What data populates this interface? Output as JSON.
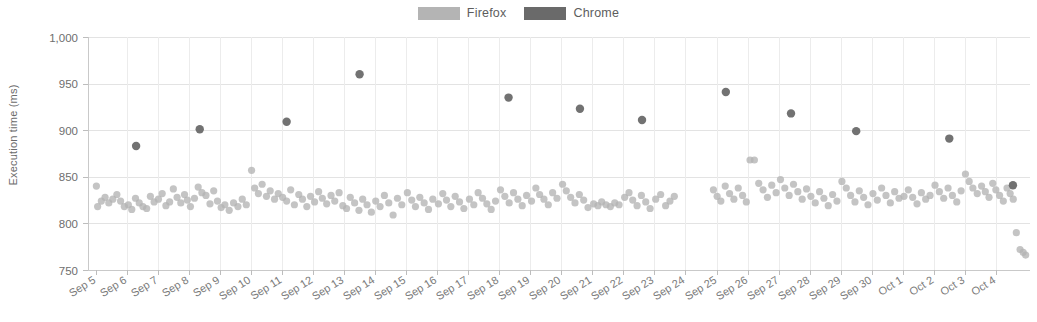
{
  "chart_data": {
    "type": "scatter",
    "title": "",
    "xlabel": "",
    "ylabel": "Execution time (ms)",
    "ylim": [
      750,
      1000
    ],
    "yticks": [
      750,
      800,
      850,
      900,
      950,
      1000
    ],
    "ytick_labels": [
      "750",
      "800",
      "850",
      "900",
      "950",
      "1,000"
    ],
    "grid": true,
    "legend_position": "top-center",
    "categories": [
      "Sep 5",
      "Sep 6",
      "Sep 7",
      "Sep 8",
      "Sep 9",
      "Sep 10",
      "Sep 11",
      "Sep 12",
      "Sep 13",
      "Sep 14",
      "Sep 15",
      "Sep 16",
      "Sep 17",
      "Sep 18",
      "Sep 19",
      "Sep 20",
      "Sep 21",
      "Sep 22",
      "Sep 23",
      "Sep 24",
      "Sep 25",
      "Sep 26",
      "Sep 27",
      "Sep 28",
      "Sep 29",
      "Sep 30",
      "Oct 1",
      "Oct 2",
      "Oct 3",
      "Oct 4"
    ],
    "series": [
      {
        "name": "Firefox",
        "color": "#b4b4b4",
        "points": [
          [
            5.02,
            840
          ],
          [
            5.06,
            818
          ],
          [
            5.18,
            824
          ],
          [
            5.3,
            828
          ],
          [
            5.42,
            822
          ],
          [
            5.55,
            826
          ],
          [
            5.68,
            831
          ],
          [
            5.8,
            824
          ],
          [
            5.92,
            818
          ],
          [
            6.05,
            820
          ],
          [
            6.16,
            815
          ],
          [
            6.28,
            827
          ],
          [
            6.4,
            822
          ],
          [
            6.52,
            818
          ],
          [
            6.64,
            816
          ],
          [
            6.76,
            829
          ],
          [
            6.88,
            823
          ],
          [
            7.02,
            826
          ],
          [
            7.14,
            832
          ],
          [
            7.26,
            819
          ],
          [
            7.38,
            823
          ],
          [
            7.5,
            837
          ],
          [
            7.62,
            828
          ],
          [
            7.74,
            822
          ],
          [
            7.86,
            831
          ],
          [
            7.95,
            825
          ],
          [
            8.05,
            818
          ],
          [
            8.18,
            827
          ],
          [
            8.3,
            839
          ],
          [
            8.42,
            833
          ],
          [
            8.55,
            830
          ],
          [
            8.68,
            821
          ],
          [
            8.8,
            835
          ],
          [
            8.92,
            824
          ],
          [
            9.04,
            817
          ],
          [
            9.16,
            820
          ],
          [
            9.3,
            814
          ],
          [
            9.44,
            822
          ],
          [
            9.58,
            818
          ],
          [
            9.72,
            826
          ],
          [
            9.85,
            820
          ],
          [
            10.02,
            857
          ],
          [
            10.12,
            838
          ],
          [
            10.24,
            832
          ],
          [
            10.36,
            842
          ],
          [
            10.5,
            829
          ],
          [
            10.62,
            835
          ],
          [
            10.76,
            826
          ],
          [
            10.88,
            832
          ],
          [
            11.02,
            828
          ],
          [
            11.15,
            824
          ],
          [
            11.28,
            836
          ],
          [
            11.4,
            820
          ],
          [
            11.54,
            831
          ],
          [
            11.66,
            826
          ],
          [
            11.8,
            818
          ],
          [
            11.92,
            829
          ],
          [
            12.05,
            823
          ],
          [
            12.18,
            834
          ],
          [
            12.3,
            827
          ],
          [
            12.44,
            821
          ],
          [
            12.58,
            830
          ],
          [
            12.7,
            824
          ],
          [
            12.84,
            833
          ],
          [
            12.96,
            819
          ],
          [
            13.08,
            816
          ],
          [
            13.2,
            828
          ],
          [
            13.34,
            822
          ],
          [
            13.48,
            814
          ],
          [
            13.6,
            826
          ],
          [
            13.74,
            820
          ],
          [
            13.88,
            812
          ],
          [
            14.02,
            824
          ],
          [
            14.16,
            818
          ],
          [
            14.3,
            830
          ],
          [
            14.44,
            822
          ],
          [
            14.58,
            809
          ],
          [
            14.72,
            827
          ],
          [
            14.86,
            820
          ],
          [
            15.04,
            833
          ],
          [
            15.18,
            825
          ],
          [
            15.3,
            818
          ],
          [
            15.44,
            828
          ],
          [
            15.58,
            822
          ],
          [
            15.72,
            815
          ],
          [
            15.86,
            826
          ],
          [
            16.04,
            821
          ],
          [
            16.18,
            832
          ],
          [
            16.3,
            825
          ],
          [
            16.44,
            818
          ],
          [
            16.58,
            829
          ],
          [
            16.72,
            823
          ],
          [
            16.86,
            816
          ],
          [
            17.04,
            826
          ],
          [
            17.18,
            820
          ],
          [
            17.32,
            833
          ],
          [
            17.46,
            827
          ],
          [
            17.6,
            821
          ],
          [
            17.74,
            815
          ],
          [
            17.88,
            824
          ],
          [
            18.04,
            836
          ],
          [
            18.18,
            829
          ],
          [
            18.32,
            822
          ],
          [
            18.46,
            833
          ],
          [
            18.6,
            826
          ],
          [
            18.74,
            819
          ],
          [
            18.88,
            830
          ],
          [
            19.04,
            824
          ],
          [
            19.18,
            838
          ],
          [
            19.3,
            831
          ],
          [
            19.44,
            826
          ],
          [
            19.58,
            820
          ],
          [
            19.72,
            833
          ],
          [
            19.86,
            827
          ],
          [
            20.04,
            842
          ],
          [
            20.16,
            835
          ],
          [
            20.3,
            828
          ],
          [
            20.44,
            822
          ],
          [
            20.58,
            831
          ],
          [
            20.72,
            825
          ],
          [
            20.86,
            817
          ],
          [
            21.04,
            821
          ],
          [
            21.18,
            819
          ],
          [
            21.3,
            823
          ],
          [
            21.44,
            820
          ],
          [
            21.58,
            818
          ],
          [
            21.72,
            822
          ],
          [
            21.86,
            820
          ],
          [
            22.04,
            828
          ],
          [
            22.18,
            833
          ],
          [
            22.3,
            825
          ],
          [
            22.44,
            819
          ],
          [
            22.58,
            830
          ],
          [
            22.72,
            823
          ],
          [
            22.86,
            816
          ],
          [
            23.04,
            826
          ],
          [
            23.2,
            831
          ],
          [
            23.36,
            819
          ],
          [
            23.5,
            824
          ],
          [
            23.64,
            829
          ],
          [
            24.9,
            836
          ],
          [
            25.02,
            829
          ],
          [
            25.14,
            824
          ],
          [
            25.28,
            840
          ],
          [
            25.42,
            832
          ],
          [
            25.56,
            826
          ],
          [
            25.7,
            838
          ],
          [
            25.84,
            830
          ],
          [
            25.96,
            823
          ],
          [
            26.08,
            868
          ],
          [
            26.22,
            868
          ],
          [
            26.36,
            843
          ],
          [
            26.5,
            836
          ],
          [
            26.64,
            828
          ],
          [
            26.78,
            841
          ],
          [
            26.92,
            833
          ],
          [
            27.06,
            847
          ],
          [
            27.2,
            838
          ],
          [
            27.34,
            830
          ],
          [
            27.48,
            842
          ],
          [
            27.62,
            834
          ],
          [
            27.76,
            826
          ],
          [
            27.9,
            837
          ],
          [
            28.04,
            829
          ],
          [
            28.18,
            822
          ],
          [
            28.32,
            834
          ],
          [
            28.46,
            827
          ],
          [
            28.6,
            819
          ],
          [
            28.74,
            831
          ],
          [
            28.88,
            824
          ],
          [
            29.04,
            845
          ],
          [
            29.18,
            838
          ],
          [
            29.32,
            830
          ],
          [
            29.46,
            823
          ],
          [
            29.6,
            835
          ],
          [
            29.74,
            828
          ],
          [
            29.88,
            820
          ],
          [
            30.04,
            832
          ],
          [
            30.18,
            825
          ],
          [
            30.32,
            838
          ],
          [
            30.46,
            830
          ],
          [
            30.6,
            822
          ],
          [
            30.74,
            834
          ],
          [
            30.88,
            827
          ],
          [
            31.04,
            829
          ],
          [
            31.18,
            836
          ],
          [
            31.32,
            828
          ],
          [
            31.46,
            821
          ],
          [
            31.6,
            833
          ],
          [
            31.74,
            826
          ],
          [
            31.88,
            830
          ],
          [
            32.04,
            841
          ],
          [
            32.18,
            834
          ],
          [
            32.32,
            827
          ],
          [
            32.46,
            838
          ],
          [
            32.6,
            830
          ],
          [
            32.74,
            823
          ],
          [
            32.88,
            835
          ],
          [
            33.02,
            853
          ],
          [
            33.14,
            845
          ],
          [
            33.26,
            838
          ],
          [
            33.4,
            832
          ],
          [
            33.54,
            840
          ],
          [
            33.66,
            834
          ],
          [
            33.78,
            828
          ],
          [
            33.9,
            843
          ],
          [
            34.0,
            836
          ],
          [
            34.12,
            830
          ],
          [
            34.24,
            824
          ],
          [
            34.36,
            838
          ],
          [
            34.46,
            832
          ],
          [
            34.56,
            826
          ],
          [
            34.66,
            790
          ],
          [
            34.78,
            772
          ],
          [
            34.88,
            769
          ],
          [
            34.96,
            766
          ]
        ]
      },
      {
        "name": "Chrome",
        "color": "#6a6a6a",
        "points": [
          [
            6.3,
            883
          ],
          [
            8.35,
            901
          ],
          [
            11.15,
            909
          ],
          [
            13.5,
            960
          ],
          [
            18.3,
            935
          ],
          [
            20.6,
            923
          ],
          [
            22.6,
            911
          ],
          [
            25.3,
            941
          ],
          [
            27.4,
            918
          ],
          [
            29.5,
            899
          ],
          [
            32.5,
            891
          ],
          [
            34.55,
            841
          ]
        ]
      }
    ]
  },
  "legend": {
    "entries": [
      {
        "label": "Firefox",
        "color": "#b4b4b4",
        "swatch": "legend-swatch-firefox"
      },
      {
        "label": "Chrome",
        "color": "#6a6a6a",
        "swatch": "legend-swatch-chrome"
      }
    ]
  }
}
